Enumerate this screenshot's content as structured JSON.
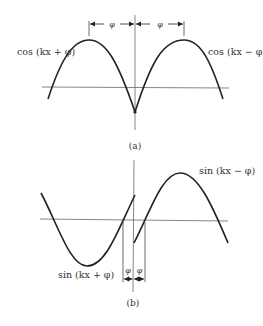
{
  "panel_a": {
    "caption": "(a)",
    "left_label": "cos (kx + φ)",
    "right_label": "cos (kx − φ)",
    "phase_left": "φ",
    "phase_right": "φ"
  },
  "panel_b": {
    "caption": "(b)",
    "left_label": "sin (kx + φ)",
    "right_label": "sin (kx − φ)",
    "phase_left": "φ",
    "phase_right": "φ"
  },
  "colors": {
    "line": "#222222",
    "axis": "#555555",
    "text": "#333333"
  }
}
